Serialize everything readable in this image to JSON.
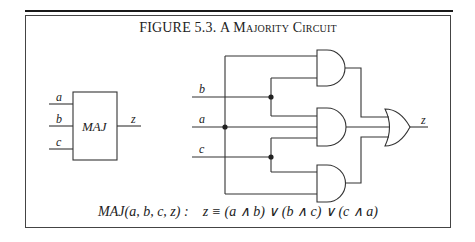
{
  "figure": {
    "title_prefix": "FIGURE 5.3.",
    "title_rest": "A Majority Circuit",
    "block": {
      "label": "MAJ",
      "inputs": [
        "a",
        "b",
        "c"
      ],
      "output": "z"
    },
    "circuit": {
      "inputs": [
        "b",
        "a",
        "c"
      ],
      "output": "z",
      "gates": [
        {
          "type": "AND",
          "inputs": [
            "a",
            "b"
          ]
        },
        {
          "type": "AND",
          "inputs": [
            "b",
            "c"
          ]
        },
        {
          "type": "AND",
          "inputs": [
            "c",
            "a"
          ]
        },
        {
          "type": "OR",
          "inputs": [
            "AND1",
            "AND2",
            "AND3"
          ],
          "output": "z"
        }
      ]
    },
    "formula": {
      "lhs": "MAJ(a, b, c, z) :",
      "rhs": "z ≡ (a ∧ b) ∨ (b ∧ c) ∨ (c ∧ a)"
    }
  }
}
